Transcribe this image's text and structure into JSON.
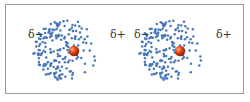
{
  "diagram": {
    "title": "",
    "panels": [
      {
        "id": "left",
        "label_negative": "δ−",
        "label_positive": "δ+",
        "nucleus_color": "#e0441a",
        "electron_color": "#4a78b8",
        "description": "electron cloud shifted toward negative side"
      },
      {
        "id": "right",
        "label_negative": "δ−",
        "label_positive": "δ+",
        "nucleus_color": "#e0441a",
        "electron_color": "#4a78b8",
        "description": "electron cloud shifted toward negative side"
      }
    ]
  }
}
